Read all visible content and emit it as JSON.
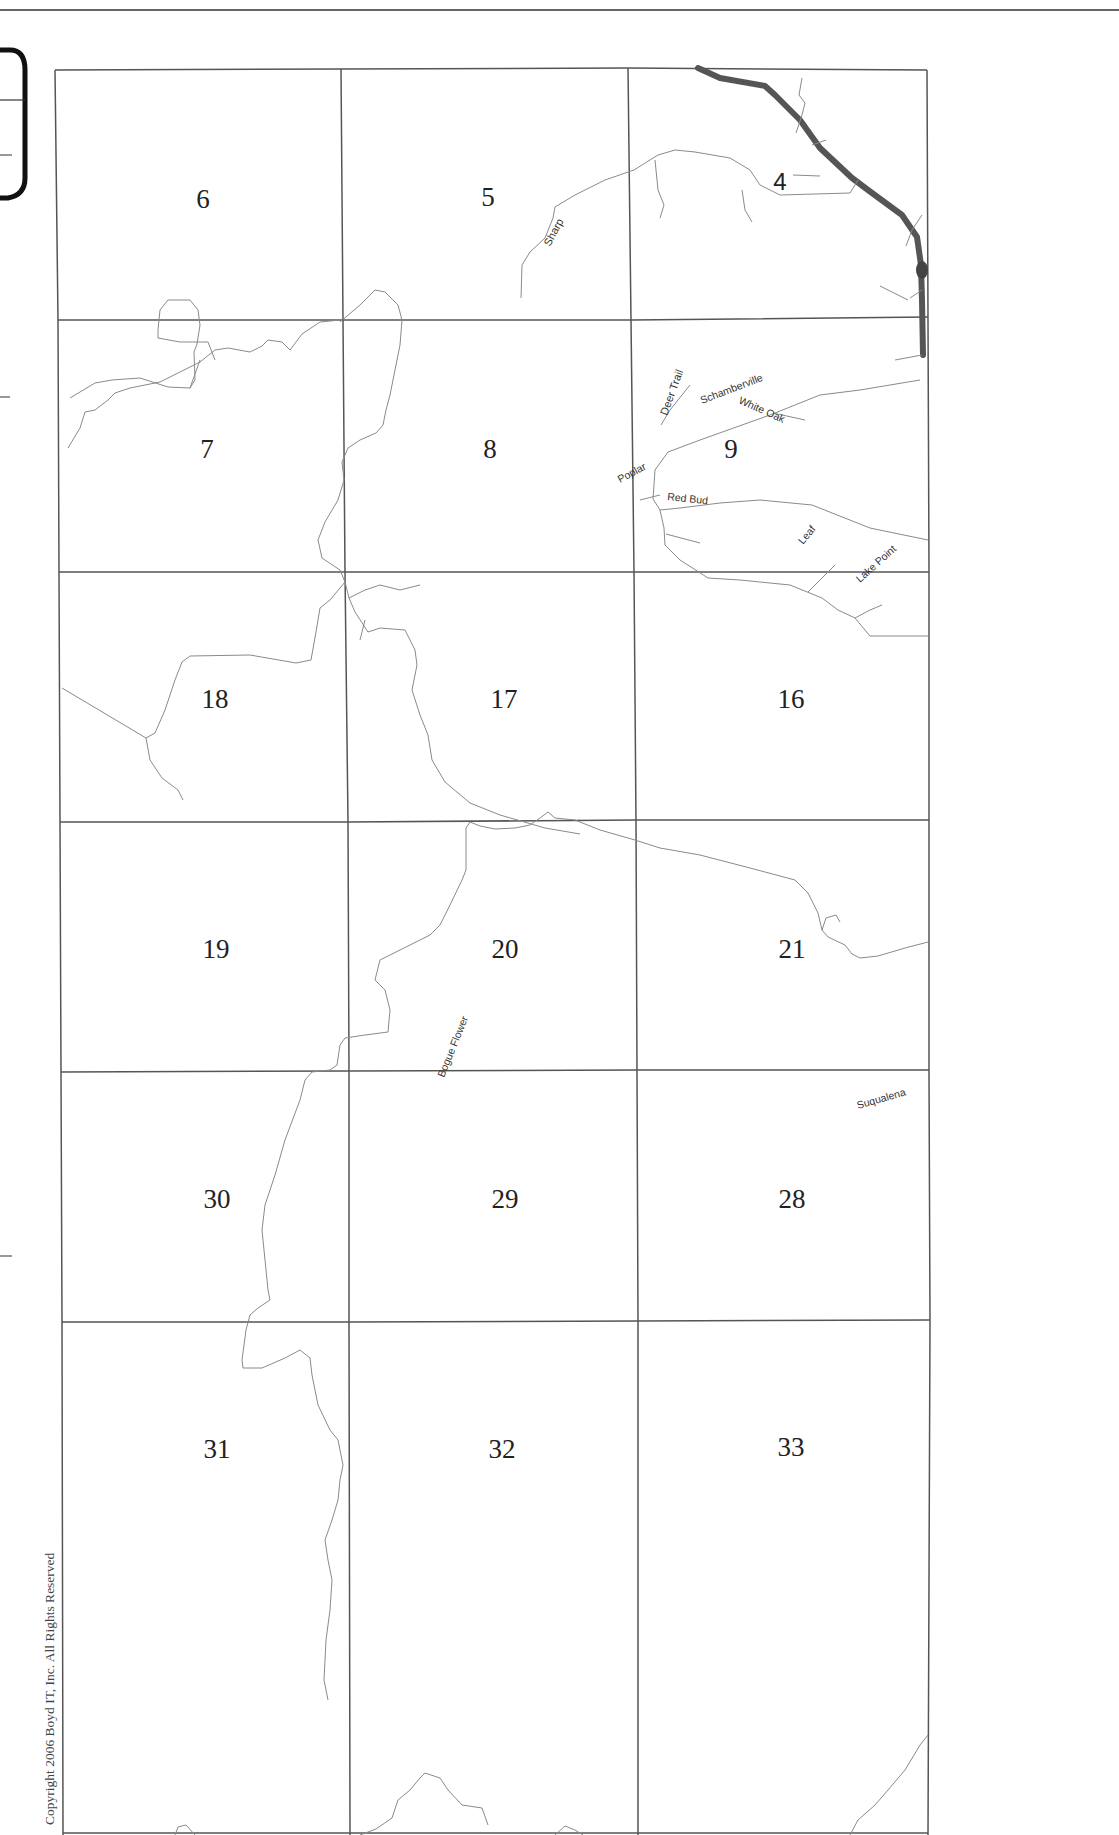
{
  "map": {
    "copyright": "Copyright 2006 Boyd IT, Inc. All Rights Reserved",
    "colors": {
      "grid": "#555555",
      "road": "#8a8a8a",
      "highway": "#555555",
      "text": "#222222"
    },
    "sections": [
      {
        "id": "6",
        "x": 203,
        "y": 208
      },
      {
        "id": "5",
        "x": 488,
        "y": 206
      },
      {
        "id": "4",
        "x": 780,
        "y": 190
      },
      {
        "id": "7",
        "x": 207,
        "y": 458
      },
      {
        "id": "8",
        "x": 490,
        "y": 458
      },
      {
        "id": "9",
        "x": 731,
        "y": 458
      },
      {
        "id": "18",
        "x": 215,
        "y": 708
      },
      {
        "id": "17",
        "x": 504,
        "y": 708
      },
      {
        "id": "16",
        "x": 791,
        "y": 708
      },
      {
        "id": "19",
        "x": 216,
        "y": 958
      },
      {
        "id": "20",
        "x": 505,
        "y": 958
      },
      {
        "id": "21",
        "x": 792,
        "y": 958
      },
      {
        "id": "30",
        "x": 217,
        "y": 1208
      },
      {
        "id": "29",
        "x": 505,
        "y": 1208
      },
      {
        "id": "28",
        "x": 792,
        "y": 1208
      },
      {
        "id": "31",
        "x": 217,
        "y": 1458
      },
      {
        "id": "32",
        "x": 502,
        "y": 1458
      },
      {
        "id": "33",
        "x": 791,
        "y": 1456
      }
    ],
    "road_labels": [
      {
        "name": "Sharp",
        "x": 548,
        "y": 248,
        "angle": -62
      },
      {
        "name": "Deer Trail",
        "x": 665,
        "y": 416,
        "angle": -70
      },
      {
        "name": "Schamberville",
        "x": 703,
        "y": 404,
        "angle": -22
      },
      {
        "name": "White Oak",
        "x": 737,
        "y": 404,
        "angle": 25
      },
      {
        "name": "Poplar",
        "x": 619,
        "y": 484,
        "angle": -28
      },
      {
        "name": "Red Bud",
        "x": 667,
        "y": 500,
        "angle": 6
      },
      {
        "name": "Leaf",
        "x": 801,
        "y": 546,
        "angle": -50
      },
      {
        "name": "Lake Point",
        "x": 858,
        "y": 583,
        "angle": -42
      },
      {
        "name": "Suqualena",
        "x": 857,
        "y": 1108,
        "angle": -16
      },
      {
        "name": "Bogue Flower",
        "x": 442,
        "y": 1078,
        "angle": -68
      }
    ]
  }
}
